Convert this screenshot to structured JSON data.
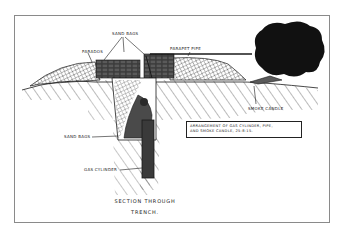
{
  "figure": {
    "title_line1": "Section Through",
    "title_line2": "Trench.",
    "note_line1": "Arrangement of gas cylinder, pipe,",
    "note_line2": "and smoke candle,   25-8-15.",
    "labels": {
      "sand_bags_top": "Sand bags",
      "parados": "Parados",
      "parapet_pipe": "Parapet pipe",
      "smoke_candle": "Smoke candle",
      "sand_bags_side": "Sand bags",
      "gas_cylinder": "Gas cylinder"
    },
    "colors": {
      "ink": "#1a1a1a",
      "frame": "#8a8a8a",
      "paper": "#ffffff"
    }
  }
}
